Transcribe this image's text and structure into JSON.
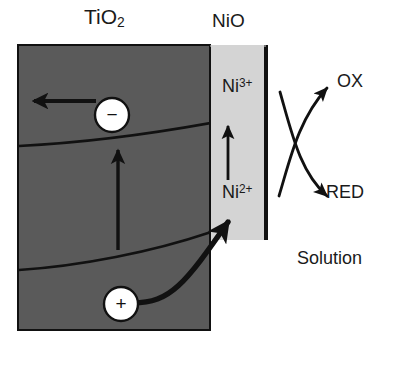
{
  "figure": {
    "width": 395,
    "height": 368,
    "background_color": "#ffffff"
  },
  "layers": {
    "semiconductor": {
      "label": "TiO",
      "label_subscript": "2",
      "fill_color": "#5a5a5a",
      "border_color": "#111111"
    },
    "catalyst": {
      "label": "NiO",
      "fill_color": "#d4d4d4",
      "border_color": "#111111"
    },
    "electrolyte": {
      "label": "Solution",
      "fill_color": "#ffffff"
    }
  },
  "species": {
    "oxidized_nickel": {
      "text": "Ni",
      "charge": "3+"
    },
    "reduced_nickel": {
      "text": "Ni",
      "charge": "2+"
    },
    "oxidant": "OX",
    "reductant": "RED"
  },
  "carriers": {
    "electron": {
      "sign": "−",
      "fill_color": "#ffffff",
      "stroke_color": "#111111"
    },
    "hole": {
      "sign": "+",
      "fill_color": "#ffffff",
      "stroke_color": "#111111"
    }
  },
  "arrows": {
    "electron_transport": "electron-arrow-left",
    "band_bending_up": "vertical-arrow-up-in-tio2",
    "nickel_oxidation": "vertical-arrow-up-in-nio",
    "hole_transfer": "curved-arrow-hole-to-nio",
    "oxidation_branch": "curved-arrow-up-right-ox",
    "reduction_branch": "curved-arrow-down-left-red"
  },
  "band_edges": {
    "conduction_band": "upper-curved-band-edge",
    "valence_band": "lower-curved-band-edge"
  }
}
